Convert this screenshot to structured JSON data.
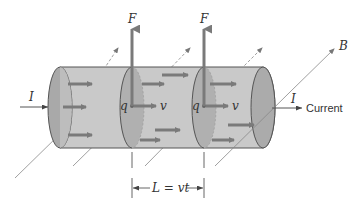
{
  "diagram": {
    "colors": {
      "cylinder_body": "#c9c9c9",
      "cylinder_face": "#a9a9a9",
      "outline": "#555555",
      "arrow": "#7a7a7a",
      "field_line": "#888888",
      "text": "#333333"
    },
    "labels": {
      "force_left": "F",
      "force_right": "F",
      "field": "B",
      "current_in": "I",
      "current_out": "I",
      "current_word": "Current",
      "charge_left": "q",
      "charge_right": "q",
      "velocity_left": "v",
      "velocity_right": "v",
      "length": "L = vt"
    },
    "icons": {
      "force_arrow": "arrow-up-icon",
      "velocity_arrow": "arrow-right-icon",
      "field_arrow": "arrow-diagonal-icon",
      "dimension_arrow": "double-arrow-icon"
    }
  }
}
